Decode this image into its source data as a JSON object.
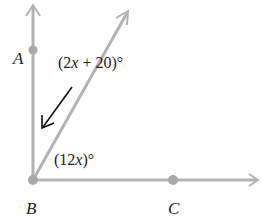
{
  "diagram": {
    "vertex": {
      "label": "B",
      "x": 33,
      "y": 180
    },
    "points": [
      {
        "label": "A",
        "x": 33,
        "y": 50
      },
      {
        "label": "C",
        "x": 173,
        "y": 180
      }
    ],
    "rays": [
      {
        "name": "ray-BA",
        "to": [
          33,
          6
        ]
      },
      {
        "name": "ray-diagonal",
        "to": [
          128,
          12
        ]
      },
      {
        "name": "ray-BC",
        "to": [
          258,
          180
        ]
      }
    ],
    "angles": [
      {
        "label_prefix": "(2",
        "var": "x",
        "label_suffix": " + 20)°",
        "between": "BA and diagonal"
      },
      {
        "label_prefix": "(12",
        "var": "x",
        "label_suffix": ")°",
        "between": "diagonal and BC"
      }
    ],
    "colors": {
      "ray": "#b3b3b3",
      "point": "#a8a8a8",
      "text": "#222222",
      "pointer": "#111111"
    }
  }
}
